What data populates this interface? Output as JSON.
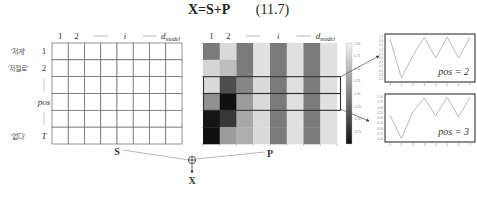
{
  "equation": {
    "lhs": "X=S+P",
    "number": "(11.7)"
  },
  "left_table": {
    "label": "S",
    "col_headers": [
      "1",
      "2",
      "——",
      "i",
      "——",
      "d_model"
    ],
    "col_header_sub": "model",
    "row_headers": [
      "1",
      "2",
      "|",
      "pos",
      "|",
      "T"
    ],
    "row_tokens": [
      "'저게'",
      "'저절로'",
      "",
      "",
      "",
      "'없다'"
    ],
    "rows": 6,
    "cols": 8
  },
  "heatmap": {
    "label": "P",
    "col_headers": [
      "1",
      "2",
      "——",
      "i",
      "——",
      "d_model"
    ],
    "values": [
      [
        0.0,
        0.85,
        0.0,
        0.9,
        0.0,
        0.9,
        0.0,
        0.9
      ],
      [
        0.8,
        0.6,
        0.0,
        0.9,
        0.0,
        0.9,
        0.0,
        0.9
      ],
      [
        0.85,
        -0.4,
        0.1,
        0.85,
        0.0,
        0.9,
        0.0,
        0.9
      ],
      [
        0.2,
        -0.95,
        0.3,
        0.85,
        0.0,
        0.9,
        0.0,
        0.9
      ],
      [
        -0.9,
        -0.6,
        0.4,
        0.85,
        0.0,
        0.9,
        0.0,
        0.9
      ],
      [
        -0.95,
        0.3,
        0.45,
        0.85,
        0.0,
        0.9,
        0.0,
        0.9
      ]
    ],
    "highlighted_rows": [
      2,
      3
    ],
    "colorbar_ticks": [
      "1.00",
      "0.75",
      "0.50",
      "0.25",
      "0.00",
      "-0.25",
      "-0.50",
      "-0.75"
    ],
    "colorbar_range": [
      -1,
      1
    ]
  },
  "combine": {
    "operator": "⊕",
    "result": "X"
  },
  "chart_data": [
    {
      "type": "line",
      "title": "",
      "annotation": "pos = 2",
      "x": [
        0,
        1,
        2,
        3,
        4,
        5,
        6,
        7
      ],
      "values": [
        0.9,
        -0.95,
        0.1,
        0.98,
        0.0,
        0.99,
        0.0,
        0.99
      ],
      "ylim": [
        -1,
        1
      ],
      "ytick_labels": [
        "1.0",
        "0.8",
        "0.6",
        "0.4",
        "0.2",
        "0.0",
        "-0.2",
        "-0.4",
        "-0.6",
        "-0.8",
        "-1.0"
      ],
      "xtick_labels": [
        "0",
        "1",
        "2",
        "3",
        "4",
        "5",
        "6",
        "7"
      ]
    },
    {
      "type": "line",
      "title": "",
      "annotation": "pos = 3",
      "x": [
        0,
        1,
        2,
        3,
        4,
        5,
        6,
        7
      ],
      "values": [
        0.14,
        -0.99,
        0.3,
        0.96,
        0.1,
        0.99,
        0.05,
        0.99
      ],
      "ylim": [
        -1,
        1
      ],
      "ytick_labels": [
        "1.00",
        "0.75",
        "0.50",
        "0.25",
        "0.00",
        "-0.25",
        "-0.50",
        "-0.75",
        "-1.00"
      ],
      "xtick_labels": [
        "0",
        "1",
        "2",
        "3",
        "4",
        "5",
        "6",
        "7"
      ]
    }
  ]
}
